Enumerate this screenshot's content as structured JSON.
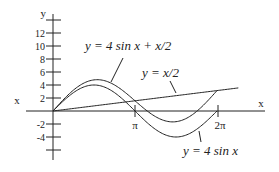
{
  "chart_data": {
    "type": "line",
    "title": "",
    "xlabel": "x",
    "ylabel": "y",
    "left_axis_label": "x",
    "x_ticks": [
      {
        "label": "π",
        "value": 3.14159
      },
      {
        "label": "2π",
        "value": 6.28318
      }
    ],
    "y_ticks": [
      {
        "label": "12",
        "value": 12
      },
      {
        "label": "10",
        "value": 10
      },
      {
        "label": "8",
        "value": 8
      },
      {
        "label": "6",
        "value": 6
      },
      {
        "label": "4",
        "value": 4
      },
      {
        "label": "2",
        "value": 2
      },
      {
        "label": "-2",
        "value": -2
      },
      {
        "label": "-4",
        "value": -4
      }
    ],
    "xlim": [
      0,
      7.1
    ],
    "ylim": [
      -7,
      14
    ],
    "grid": false,
    "series": [
      {
        "name": "y = 4 sin x + x/2",
        "expression": "4*sin(x) + x/2",
        "domain": [
          0,
          6.28318
        ]
      },
      {
        "name": "y = x/2",
        "expression": "x/2",
        "domain": [
          0,
          7.1
        ]
      },
      {
        "name": "y = 4 sin x",
        "expression": "4*sin(x)",
        "domain": [
          0,
          6.28318
        ]
      }
    ],
    "annotations": [
      {
        "text": "y = 4 sin x + x/2",
        "points_to": "y = 4 sin x + x/2"
      },
      {
        "text": "y = x/2",
        "points_to": "y = x/2"
      },
      {
        "text": "y = 4 sin x",
        "points_to": "y = 4 sin x"
      }
    ]
  },
  "labels": {
    "y_axis": "y",
    "x_axis": "x",
    "left_x": "x",
    "pi": "π",
    "two_pi": "2π",
    "ann_sum": "y = 4 sin x + x/2",
    "ann_line": "y = x/2",
    "ann_sin": "y = 4 sin x"
  }
}
